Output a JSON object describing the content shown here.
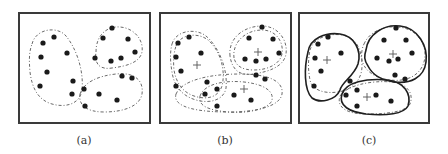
{
  "figure": {
    "panels": [
      {
        "id": "a",
        "label": "(a)",
        "clusters": 3,
        "points": 20,
        "boundary_style": "dashed",
        "centroids_shown": false
      },
      {
        "id": "b",
        "label": "(b)",
        "clusters": 3,
        "points": 20,
        "boundary_style": "dashed (two overlapping iterations)",
        "centroids_shown": true
      },
      {
        "id": "c",
        "label": "(c)",
        "clusters": 3,
        "points": 20,
        "boundary_style": "solid (final) over dashed (previous)",
        "centroids_shown": true
      }
    ]
  },
  "colors": {
    "frame": "#3a3a3a",
    "point": "#1a1a1a",
    "dashed_boundary": "#6a6a6a",
    "solid_boundary": "#1f1f1f"
  }
}
